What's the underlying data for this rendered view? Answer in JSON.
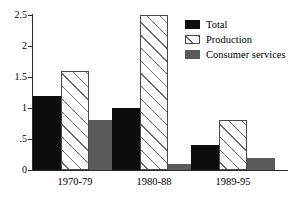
{
  "chart_data": {
    "type": "bar",
    "title": "",
    "subtitle": "",
    "xlabel": "",
    "ylabel": "",
    "categories": [
      "1970-79",
      "1980-88",
      "1989-95"
    ],
    "series": [
      {
        "name": "Total",
        "values": [
          1.2,
          1.0,
          0.4
        ],
        "color": "#0d0d0d",
        "fill": "solid-black"
      },
      {
        "name": "Production",
        "values": [
          1.6,
          2.5,
          0.8
        ],
        "color": "#ffffff",
        "fill": "diagonal-hatch"
      },
      {
        "name": "Consumer services",
        "values": [
          0.8,
          0.1,
          0.2
        ],
        "color": "#5a5a5a",
        "fill": "solid-gray"
      }
    ],
    "ylim": [
      0,
      2.5
    ],
    "yticks": [
      0,
      0.5,
      1,
      1.5,
      2,
      2.5
    ],
    "ytick_labels": [
      "0",
      ".5",
      "1",
      "1.5",
      "2",
      "2.5"
    ],
    "grid": false,
    "legend_position": "top-right",
    "legend_entries": [
      "Total",
      "Production",
      "Consumer services"
    ]
  }
}
